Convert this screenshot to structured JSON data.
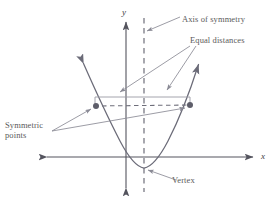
{
  "figure": {
    "labels": {
      "axis_of_symmetry": "Axis of symmetry",
      "equal_distances": "Equal distances",
      "symmetric_points_line1": "Symmetric",
      "symmetric_points_line2": "points",
      "vertex": "Vertex",
      "y_axis": "y",
      "x_axis": "x"
    },
    "colors": {
      "curve": "#6b6b78",
      "axis": "#54545e",
      "dashed": "#6e6e7a",
      "leader": "#8a8a95",
      "text": "#5a5a5a",
      "background": "#ffffff"
    },
    "geometry": {
      "x_axis_y": 157,
      "y_axis_x": 126,
      "axis_of_symmetry_x": 144,
      "vertex": {
        "x": 144,
        "y": 168
      },
      "symmetric_point_left": {
        "x": 96,
        "y": 106
      },
      "symmetric_point_right": {
        "x": 190,
        "y": 105
      },
      "bracket_left_x": 95,
      "bracket_right_x": 190,
      "bracket_y": 97
    }
  }
}
